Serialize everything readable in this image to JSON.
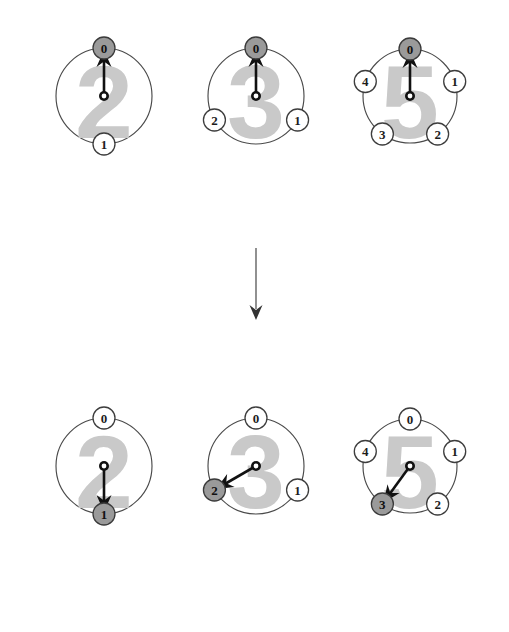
{
  "figure": {
    "background_color": "#ffffff",
    "colors": {
      "ring_stroke": "#4a4a4a",
      "node_open_fill": "#ffffff",
      "node_filled_fill": "#9a9a9a",
      "node_stroke": "#3a3a3a",
      "label_text": "#1c1c1c",
      "watermark_digit": "#c9c9c9",
      "hand": "#111111",
      "flow_arrow": "#555555"
    },
    "rows": [
      {
        "row_name": "before-row",
        "clocks": [
          {
            "name": "clock-mod-2-before",
            "watermark": "2",
            "modulus": 2,
            "center": {
              "x": 104,
              "y": 96
            },
            "radius": 48,
            "node_radius": 11,
            "hand_angle_deg": 0,
            "hand_length": 46,
            "active_node": 0,
            "nodes": [
              {
                "label": "0",
                "angle_deg": 0,
                "filled": true
              },
              {
                "label": "1",
                "angle_deg": 180,
                "filled": false
              }
            ]
          },
          {
            "name": "clock-mod-3-before",
            "watermark": "3",
            "modulus": 3,
            "center": {
              "x": 256,
              "y": 96
            },
            "radius": 48,
            "node_radius": 11,
            "hand_angle_deg": 0,
            "hand_length": 46,
            "active_node": 0,
            "nodes": [
              {
                "label": "0",
                "angle_deg": 0,
                "filled": true
              },
              {
                "label": "1",
                "angle_deg": 120,
                "filled": false
              },
              {
                "label": "2",
                "angle_deg": 240,
                "filled": false
              }
            ]
          },
          {
            "name": "clock-mod-5-before",
            "watermark": "5",
            "modulus": 5,
            "center": {
              "x": 410,
              "y": 96
            },
            "radius": 47,
            "node_radius": 11,
            "hand_angle_deg": 0,
            "hand_length": 45,
            "active_node": 0,
            "nodes": [
              {
                "label": "0",
                "angle_deg": 0,
                "filled": true
              },
              {
                "label": "1",
                "angle_deg": 72,
                "filled": false
              },
              {
                "label": "2",
                "angle_deg": 144,
                "filled": false
              },
              {
                "label": "3",
                "angle_deg": 216,
                "filled": false
              },
              {
                "label": "4",
                "angle_deg": 288,
                "filled": false
              }
            ]
          }
        ]
      },
      {
        "row_name": "after-row",
        "clocks": [
          {
            "name": "clock-mod-2-after",
            "watermark": "2",
            "modulus": 2,
            "center": {
              "x": 104,
              "y": 466
            },
            "radius": 48,
            "node_radius": 11,
            "hand_angle_deg": 180,
            "hand_length": 46,
            "active_node": 1,
            "nodes": [
              {
                "label": "0",
                "angle_deg": 0,
                "filled": false
              },
              {
                "label": "1",
                "angle_deg": 180,
                "filled": true
              }
            ]
          },
          {
            "name": "clock-mod-3-after",
            "watermark": "3",
            "modulus": 3,
            "center": {
              "x": 256,
              "y": 466
            },
            "radius": 48,
            "node_radius": 11,
            "hand_angle_deg": 240,
            "hand_length": 46,
            "active_node": 2,
            "nodes": [
              {
                "label": "0",
                "angle_deg": 0,
                "filled": false
              },
              {
                "label": "1",
                "angle_deg": 120,
                "filled": false
              },
              {
                "label": "2",
                "angle_deg": 240,
                "filled": true
              }
            ]
          },
          {
            "name": "clock-mod-5-after",
            "watermark": "5",
            "modulus": 5,
            "center": {
              "x": 410,
              "y": 466
            },
            "radius": 47,
            "node_radius": 11,
            "hand_angle_deg": 216,
            "hand_length": 45,
            "active_node": 3,
            "nodes": [
              {
                "label": "0",
                "angle_deg": 0,
                "filled": false
              },
              {
                "label": "1",
                "angle_deg": 72,
                "filled": false
              },
              {
                "label": "2",
                "angle_deg": 144,
                "filled": false
              },
              {
                "label": "3",
                "angle_deg": 216,
                "filled": true
              },
              {
                "label": "4",
                "angle_deg": 288,
                "filled": false
              }
            ]
          }
        ]
      }
    ],
    "flow_arrow": {
      "name": "downward-flow-arrow",
      "x": 256,
      "y_start": 248,
      "y_end": 320
    }
  }
}
